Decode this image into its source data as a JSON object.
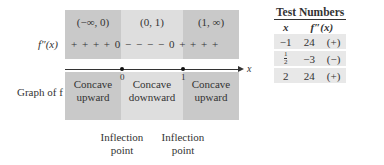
{
  "diagram": {
    "intervals": [
      "(−∞, 0)",
      "(0, 1)",
      "(1, ∞)"
    ],
    "row_label_fpp": "f″(x)",
    "signs": "+ + + +  0  − − − −  0  + + + +",
    "axis_label": "x",
    "ticks": [
      "0",
      "1"
    ],
    "row_label_graph": "Graph of f",
    "concavity": [
      {
        "line1": "Concave",
        "line2": "upward"
      },
      {
        "line1": "Concave",
        "line2": "downward"
      },
      {
        "line1": "Concave",
        "line2": "upward"
      }
    ],
    "inflection_points": [
      {
        "line1": "Inflection",
        "line2": "point"
      },
      {
        "line1": "Inflection",
        "line2": "point"
      }
    ],
    "colors": {
      "outer_region": "#c9c9c9",
      "middle_region": "#dedede",
      "table_cell": "#e8e8e8"
    }
  },
  "table": {
    "title": "Test Numbers",
    "headers": [
      "x",
      "f″(x)"
    ],
    "rows": [
      {
        "x": "−1",
        "value": "24",
        "sign": "(+)"
      },
      {
        "x_num": "1",
        "x_den": "2",
        "value": "−3",
        "sign": "(−)"
      },
      {
        "x": "2",
        "value": "24",
        "sign": "(+)"
      }
    ]
  }
}
